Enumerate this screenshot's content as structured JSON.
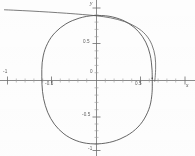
{
  "figure": {
    "background_color": "#fdfdfd",
    "curve_color": "#4a4a4a",
    "axis_color": "#6d6d6d",
    "label_color": "#5e5e5e"
  },
  "axes": {
    "x_axis_label": "x",
    "y_axis_label": "y",
    "origin_label": "0"
  },
  "chart_data": {
    "type": "line",
    "title": "",
    "xlabel": "x",
    "ylabel": "y",
    "xlim": [
      -1.05,
      1.12
    ],
    "ylim": [
      -1.05,
      1.05
    ],
    "grid": false,
    "legend": "none",
    "x_ticks": [
      -1,
      -0.5,
      0,
      0.5
    ],
    "x_tick_labels": [
      "-1",
      "-0.5",
      "0",
      "0.5"
    ],
    "y_ticks": [
      0.5,
      0,
      -0.5,
      -1
    ],
    "y_tick_labels": [
      "0.5",
      "0",
      "-0.5",
      "-1"
    ],
    "series": [
      {
        "name": "closed-oval-branch",
        "kind": "closed-curve",
        "description": "Closed rounded-square (superellipse-like) loop centred near the origin, crossing the x-axis near -0.62 and +0.63 and the y-axis near +0.88 and -0.86.",
        "points": [
          [
            0.63,
            0.03
          ],
          [
            0.628,
            0.14
          ],
          [
            0.62,
            0.25
          ],
          [
            0.606,
            0.35
          ],
          [
            0.585,
            0.44
          ],
          [
            0.556,
            0.522
          ],
          [
            0.52,
            0.596
          ],
          [
            0.476,
            0.664
          ],
          [
            0.424,
            0.724
          ],
          [
            0.364,
            0.776
          ],
          [
            0.296,
            0.82
          ],
          [
            0.222,
            0.852
          ],
          [
            0.142,
            0.874
          ],
          [
            0.058,
            0.884
          ],
          [
            -0.028,
            0.884
          ],
          [
            -0.114,
            0.872
          ],
          [
            -0.196,
            0.848
          ],
          [
            -0.274,
            0.814
          ],
          [
            -0.346,
            0.77
          ],
          [
            -0.41,
            0.716
          ],
          [
            -0.466,
            0.654
          ],
          [
            -0.514,
            0.584
          ],
          [
            -0.552,
            0.506
          ],
          [
            -0.582,
            0.422
          ],
          [
            -0.602,
            0.334
          ],
          [
            -0.614,
            0.242
          ],
          [
            -0.618,
            0.148
          ],
          [
            -0.618,
            0.05
          ],
          [
            -0.616,
            -0.05
          ],
          [
            -0.61,
            -0.15
          ],
          [
            -0.598,
            -0.248
          ],
          [
            -0.578,
            -0.342
          ],
          [
            -0.552,
            -0.432
          ],
          [
            -0.518,
            -0.516
          ],
          [
            -0.476,
            -0.594
          ],
          [
            -0.426,
            -0.664
          ],
          [
            -0.368,
            -0.726
          ],
          [
            -0.302,
            -0.778
          ],
          [
            -0.23,
            -0.818
          ],
          [
            -0.152,
            -0.846
          ],
          [
            -0.07,
            -0.86
          ],
          [
            0.016,
            -0.862
          ],
          [
            0.102,
            -0.852
          ],
          [
            0.186,
            -0.83
          ],
          [
            0.266,
            -0.796
          ],
          [
            0.34,
            -0.752
          ],
          [
            0.408,
            -0.698
          ],
          [
            0.468,
            -0.634
          ],
          [
            0.518,
            -0.562
          ],
          [
            0.558,
            -0.482
          ],
          [
            0.59,
            -0.396
          ],
          [
            0.612,
            -0.306
          ],
          [
            0.624,
            -0.212
          ],
          [
            0.63,
            -0.114
          ],
          [
            0.63,
            0.03
          ]
        ]
      },
      {
        "name": "upper-outer-branch",
        "kind": "open-curve",
        "description": "Nearly horizontal branch entering at the left edge near y = 0.96, descending gently to the right, passing just above the loop top, then sweeping steeply down to merge with the loop near x = 0.64 on the x-axis.",
        "points": [
          [
            -1.04,
            0.962
          ],
          [
            -0.94,
            0.957
          ],
          [
            -0.84,
            0.951
          ],
          [
            -0.74,
            0.945
          ],
          [
            -0.64,
            0.938
          ],
          [
            -0.54,
            0.931
          ],
          [
            -0.44,
            0.923
          ],
          [
            -0.34,
            0.915
          ],
          [
            -0.24,
            0.906
          ],
          [
            -0.16,
            0.898
          ],
          [
            -0.08,
            0.89
          ],
          [
            0.0,
            0.88
          ],
          [
            0.08,
            0.868
          ],
          [
            0.16,
            0.852
          ],
          [
            0.24,
            0.83
          ],
          [
            0.316,
            0.802
          ],
          [
            0.386,
            0.768
          ],
          [
            0.45,
            0.726
          ],
          [
            0.508,
            0.678
          ],
          [
            0.556,
            0.622
          ],
          [
            0.596,
            0.558
          ],
          [
            0.626,
            0.486
          ],
          [
            0.648,
            0.408
          ],
          [
            0.662,
            0.326
          ],
          [
            0.668,
            0.24
          ],
          [
            0.668,
            0.152
          ],
          [
            0.664,
            0.064
          ],
          [
            0.658,
            -0.01
          ]
        ]
      }
    ],
    "annotations": []
  }
}
